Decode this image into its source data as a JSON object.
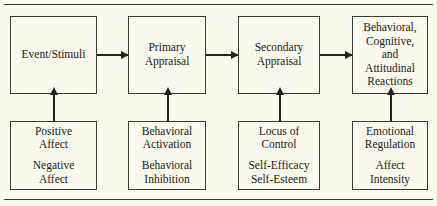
{
  "diagram": {
    "type": "flowchart",
    "title": "",
    "top_row": [
      {
        "id": "event-stimuli",
        "lines": [
          "Event/Stimuli"
        ]
      },
      {
        "id": "primary-appraisal",
        "lines": [
          "Primary",
          "Appraisal"
        ]
      },
      {
        "id": "secondary-appraisal",
        "lines": [
          "Secondary",
          "Appraisal"
        ]
      },
      {
        "id": "reactions",
        "lines": [
          "Behavioral,",
          "Cognitive,",
          "and",
          "Attitudinal",
          "Reactions"
        ]
      }
    ],
    "bottom_row": [
      {
        "id": "affect",
        "group_a": [
          "Positive",
          "Affect"
        ],
        "group_b": [
          "Negative",
          "Affect"
        ]
      },
      {
        "id": "behavioral-system",
        "group_a": [
          "Behavioral",
          "Activation"
        ],
        "group_b": [
          "Behavioral",
          "Inhibition"
        ]
      },
      {
        "id": "control-beliefs",
        "group_a": [
          "Locus of",
          "Control"
        ],
        "group_b": [
          "Self-Efficacy",
          "Self-Esteem"
        ]
      },
      {
        "id": "emotion-traits",
        "group_a": [
          "Emotional",
          "Regulation"
        ],
        "group_b": [
          "Affect",
          "Intensity"
        ]
      }
    ],
    "horizontal_arrows": [
      {
        "from": "event-stimuli",
        "to": "primary-appraisal"
      },
      {
        "from": "primary-appraisal",
        "to": "secondary-appraisal"
      },
      {
        "from": "secondary-appraisal",
        "to": "reactions"
      }
    ],
    "vertical_arrows": [
      {
        "from": "affect",
        "to": "event-stimuli"
      },
      {
        "from": "behavioral-system",
        "to": "primary-appraisal"
      },
      {
        "from": "control-beliefs",
        "to": "secondary-appraisal"
      },
      {
        "from": "emotion-traits",
        "to": "reactions"
      }
    ],
    "colors": {
      "background": "#faf9ee",
      "border": "#3a3a30",
      "text": "#1a1a14",
      "arrow": "#24241c"
    }
  }
}
